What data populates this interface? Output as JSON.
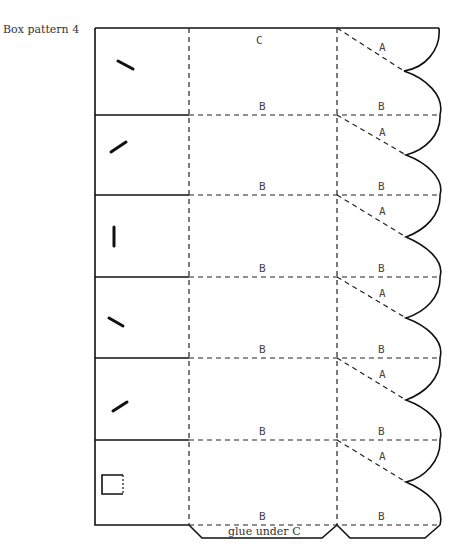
{
  "caption": "Box pattern 4",
  "labels": {
    "c": "C",
    "a": "A",
    "b": "B",
    "glue": "glue under C"
  },
  "rows": [
    {
      "panel": 1,
      "mark": "slash-down"
    },
    {
      "panel": 2,
      "mark": "slash-up"
    },
    {
      "panel": 3,
      "mark": "vertical"
    },
    {
      "panel": 4,
      "mark": "slash-down"
    },
    {
      "panel": 5,
      "mark": "slash-up"
    },
    {
      "panel": 6,
      "mark": "square"
    }
  ],
  "legend": {
    "solid_line": "cut",
    "dashed_line": "fold"
  }
}
